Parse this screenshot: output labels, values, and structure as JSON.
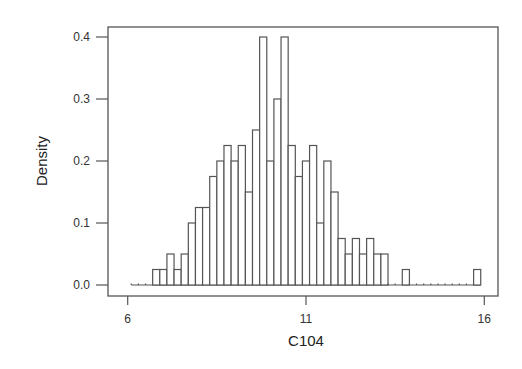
{
  "chart_data": {
    "type": "bar",
    "subtype": "histogram",
    "title": "",
    "xlabel": "C104",
    "ylabel": "Density",
    "xlim": [
      6,
      16
    ],
    "ylim": [
      0,
      0.4
    ],
    "xticks": [
      6,
      11,
      16
    ],
    "xtick_labels": [
      "6",
      "11",
      "16"
    ],
    "yticks": [
      0.0,
      0.1,
      0.2,
      0.3,
      0.4
    ],
    "ytick_labels": [
      "0.0",
      "0.1",
      "0.2",
      "0.3",
      "0.4"
    ],
    "grid": false,
    "legend": null,
    "bin_width": 0.2,
    "bin_start": 6.1,
    "bins": [
      {
        "x0": 6.1,
        "x1": 6.3,
        "density": 0
      },
      {
        "x0": 6.3,
        "x1": 6.5,
        "density": 0
      },
      {
        "x0": 6.5,
        "x1": 6.7,
        "density": 0
      },
      {
        "x0": 6.7,
        "x1": 6.9,
        "density": 0.025
      },
      {
        "x0": 6.9,
        "x1": 7.1,
        "density": 0.025
      },
      {
        "x0": 7.1,
        "x1": 7.3,
        "density": 0.05
      },
      {
        "x0": 7.3,
        "x1": 7.5,
        "density": 0.025
      },
      {
        "x0": 7.5,
        "x1": 7.7,
        "density": 0.05
      },
      {
        "x0": 7.7,
        "x1": 7.9,
        "density": 0.1
      },
      {
        "x0": 7.9,
        "x1": 8.1,
        "density": 0.125
      },
      {
        "x0": 8.1,
        "x1": 8.3,
        "density": 0.125
      },
      {
        "x0": 8.3,
        "x1": 8.5,
        "density": 0.175
      },
      {
        "x0": 8.5,
        "x1": 8.7,
        "density": 0.2
      },
      {
        "x0": 8.7,
        "x1": 8.9,
        "density": 0.225
      },
      {
        "x0": 8.9,
        "x1": 9.1,
        "density": 0.2
      },
      {
        "x0": 9.1,
        "x1": 9.3,
        "density": 0.225
      },
      {
        "x0": 9.3,
        "x1": 9.5,
        "density": 0.15
      },
      {
        "x0": 9.5,
        "x1": 9.7,
        "density": 0.25
      },
      {
        "x0": 9.7,
        "x1": 9.9,
        "density": 0.4
      },
      {
        "x0": 9.9,
        "x1": 10.1,
        "density": 0.2
      },
      {
        "x0": 10.1,
        "x1": 10.3,
        "density": 0.3
      },
      {
        "x0": 10.3,
        "x1": 10.5,
        "density": 0.4
      },
      {
        "x0": 10.5,
        "x1": 10.7,
        "density": 0.225
      },
      {
        "x0": 10.7,
        "x1": 10.9,
        "density": 0.175
      },
      {
        "x0": 10.9,
        "x1": 11.1,
        "density": 0.2
      },
      {
        "x0": 11.1,
        "x1": 11.3,
        "density": 0.225
      },
      {
        "x0": 11.3,
        "x1": 11.5,
        "density": 0.1
      },
      {
        "x0": 11.5,
        "x1": 11.7,
        "density": 0.2
      },
      {
        "x0": 11.7,
        "x1": 11.9,
        "density": 0.15
      },
      {
        "x0": 11.9,
        "x1": 12.1,
        "density": 0.075
      },
      {
        "x0": 12.1,
        "x1": 12.3,
        "density": 0.05
      },
      {
        "x0": 12.3,
        "x1": 12.5,
        "density": 0.075
      },
      {
        "x0": 12.5,
        "x1": 12.7,
        "density": 0.05
      },
      {
        "x0": 12.7,
        "x1": 12.9,
        "density": 0.075
      },
      {
        "x0": 12.9,
        "x1": 13.1,
        "density": 0.05
      },
      {
        "x0": 13.1,
        "x1": 13.3,
        "density": 0.05
      },
      {
        "x0": 13.3,
        "x1": 13.5,
        "density": 0
      },
      {
        "x0": 13.5,
        "x1": 13.7,
        "density": 0
      },
      {
        "x0": 13.7,
        "x1": 13.9,
        "density": 0.025
      },
      {
        "x0": 13.9,
        "x1": 14.1,
        "density": 0
      },
      {
        "x0": 14.1,
        "x1": 14.3,
        "density": 0
      },
      {
        "x0": 14.3,
        "x1": 14.5,
        "density": 0
      },
      {
        "x0": 14.5,
        "x1": 14.7,
        "density": 0
      },
      {
        "x0": 14.7,
        "x1": 14.9,
        "density": 0
      },
      {
        "x0": 14.9,
        "x1": 15.1,
        "density": 0
      },
      {
        "x0": 15.1,
        "x1": 15.3,
        "density": 0
      },
      {
        "x0": 15.3,
        "x1": 15.5,
        "density": 0
      },
      {
        "x0": 15.5,
        "x1": 15.7,
        "density": 0
      },
      {
        "x0": 15.7,
        "x1": 15.9,
        "density": 0.025
      }
    ]
  }
}
